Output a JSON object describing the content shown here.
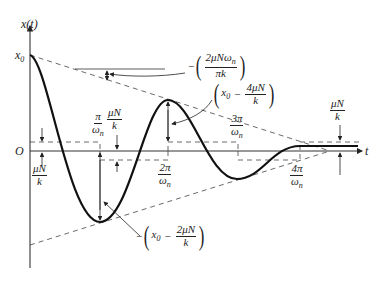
{
  "axes": {
    "y_label": "x(t)",
    "x_label": "t",
    "origin_label": "O",
    "x0_label": "x",
    "x0_sub": "0"
  },
  "annotations": {
    "decay_rate": {
      "sign": "−",
      "num": "2μNω",
      "num_sub": "n",
      "den": "πk"
    },
    "second_peak": {
      "prefix": "x",
      "prefix_sub": "0",
      "op": "−",
      "num": "4μN",
      "den": "k"
    },
    "first_trough": {
      "sign": "−",
      "prefix": "x",
      "prefix_sub": "0",
      "op": "−",
      "num": "2μN",
      "den": "k"
    },
    "band_top_left": {
      "num": "μN",
      "den": "k"
    },
    "band_bottom_left": {
      "num": "μN",
      "den": "k"
    },
    "band_right": {
      "num": "μN",
      "den": "k"
    },
    "tick_pi": {
      "num": "π",
      "den": "ω",
      "den_sub": "n"
    },
    "tick_2pi": {
      "num": "2π",
      "den": "ω",
      "den_sub": "n"
    },
    "tick_3pi": {
      "num": "3π",
      "den": "ω",
      "den_sub": "n"
    },
    "tick_4pi": {
      "num": "4π",
      "den": "ω",
      "den_sub": "n"
    }
  },
  "colors": {
    "ink": "#222222",
    "dash": "#444444"
  }
}
